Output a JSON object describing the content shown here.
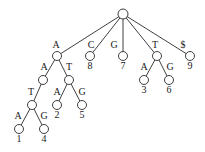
{
  "diagram": {
    "type": "suffix-tree",
    "nodes": [
      {
        "id": "root",
        "x": 123,
        "y": 14
      },
      {
        "id": "A",
        "x": 57,
        "y": 56
      },
      {
        "id": "leaf8",
        "x": 90,
        "y": 56,
        "leaf_label": "8"
      },
      {
        "id": "leaf7",
        "x": 123,
        "y": 56,
        "leaf_label": "7"
      },
      {
        "id": "T",
        "x": 157,
        "y": 56
      },
      {
        "id": "leaf9",
        "x": 190,
        "y": 56,
        "leaf_label": "9"
      },
      {
        "id": "AA",
        "x": 43,
        "y": 80
      },
      {
        "id": "AT",
        "x": 69,
        "y": 80
      },
      {
        "id": "leaf3",
        "x": 144,
        "y": 80,
        "leaf_label": "3"
      },
      {
        "id": "leaf6",
        "x": 169,
        "y": 80,
        "leaf_label": "6"
      },
      {
        "id": "AAT",
        "x": 32,
        "y": 105
      },
      {
        "id": "leaf2",
        "x": 57,
        "y": 105,
        "leaf_label": "2"
      },
      {
        "id": "leaf5",
        "x": 82,
        "y": 105,
        "leaf_label": "5"
      },
      {
        "id": "leaf1",
        "x": 19,
        "y": 129,
        "leaf_label": "1"
      },
      {
        "id": "leaf4",
        "x": 44,
        "y": 129,
        "leaf_label": "4"
      }
    ],
    "edges": [
      {
        "from": "root",
        "to": "A",
        "label": "A"
      },
      {
        "from": "root",
        "to": "leaf8",
        "label": "C"
      },
      {
        "from": "root",
        "to": "leaf7",
        "label": "G"
      },
      {
        "from": "root",
        "to": "T",
        "label": "T"
      },
      {
        "from": "root",
        "to": "leaf9",
        "label": "$"
      },
      {
        "from": "A",
        "to": "AA",
        "label": "A"
      },
      {
        "from": "A",
        "to": "AT",
        "label": "T"
      },
      {
        "from": "T",
        "to": "leaf3",
        "label": "A"
      },
      {
        "from": "T",
        "to": "leaf6",
        "label": "G"
      },
      {
        "from": "AA",
        "to": "AAT",
        "label": "T"
      },
      {
        "from": "AT",
        "to": "leaf2",
        "label": "A"
      },
      {
        "from": "AT",
        "to": "leaf5",
        "label": "G"
      },
      {
        "from": "AAT",
        "to": "leaf1",
        "label": "A"
      },
      {
        "from": "AAT",
        "to": "leaf4",
        "label": "G"
      }
    ]
  },
  "labels": {
    "edge_root_A": "A",
    "edge_root_C": "C",
    "edge_root_G": "G",
    "edge_root_T": "T",
    "edge_root_dollar": "$",
    "edge_A_A": "A",
    "edge_A_T": "T",
    "edge_T_A": "A",
    "edge_T_G": "G",
    "edge_AA_T": "T",
    "edge_AT_A": "A",
    "edge_AT_G": "G",
    "edge_AAT_A": "A",
    "edge_AAT_G": "G",
    "leaf_1": "1",
    "leaf_2": "2",
    "leaf_3": "3",
    "leaf_4": "4",
    "leaf_5": "5",
    "leaf_6": "6",
    "leaf_7": "7",
    "leaf_8": "8",
    "leaf_9": "9"
  }
}
